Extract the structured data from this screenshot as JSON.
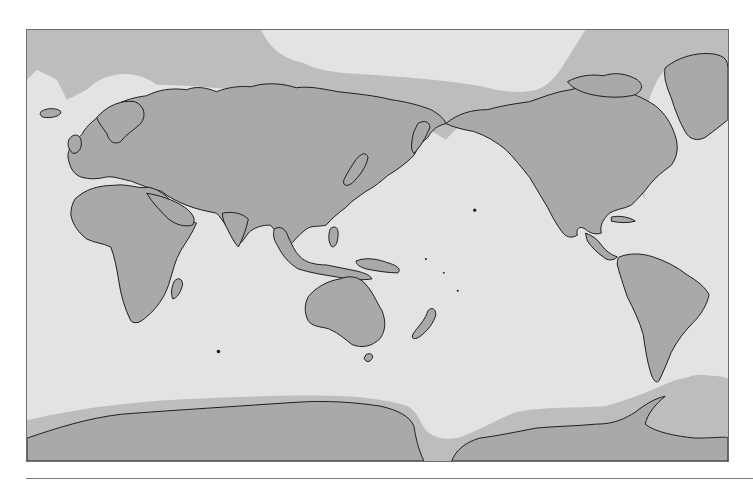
{
  "figure": {
    "type": "world-map",
    "projection": "pacific-centered",
    "has_text": false
  },
  "colors": {
    "page_background": "#ffffff",
    "sea": "#e3e3e3",
    "ice_shelf": "#bdbdbd",
    "land": "#a9a9a9",
    "coastline": "#1e1e1e",
    "frame_border": "#6e6e6e",
    "rule": "#7a7a7a"
  },
  "map": {
    "frame": {
      "x": 26,
      "y": 29,
      "width": 703,
      "height": 433
    },
    "regions": [
      {
        "name": "Europe-Asia",
        "kind": "land"
      },
      {
        "name": "Africa",
        "kind": "land"
      },
      {
        "name": "Australia",
        "kind": "land"
      },
      {
        "name": "North America",
        "kind": "land"
      },
      {
        "name": "South America",
        "kind": "land"
      },
      {
        "name": "Greenland",
        "kind": "land"
      },
      {
        "name": "Antarctica",
        "kind": "land"
      },
      {
        "name": "Arctic sea ice",
        "kind": "ice"
      },
      {
        "name": "Southern Ocean sea ice",
        "kind": "ice"
      }
    ]
  },
  "rule": {
    "y": 478,
    "x_start": 26,
    "x_end": 753
  }
}
